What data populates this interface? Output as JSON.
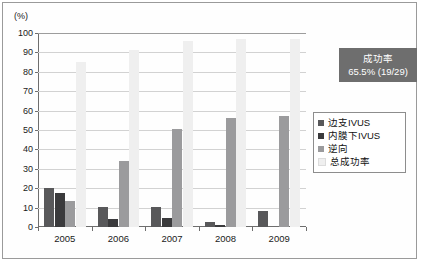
{
  "chart_data": {
    "type": "bar",
    "title": "",
    "subtitle": "",
    "xlabel": "",
    "ylabel": "(%)",
    "ylim": [
      0,
      100
    ],
    "ytick_step": 10,
    "yticks": [
      "100",
      "90",
      "80",
      "70",
      "60",
      "50",
      "40",
      "30",
      "20",
      "10",
      "0"
    ],
    "grid": true,
    "legend_position": "right",
    "categories": [
      "2005",
      "2006",
      "2007",
      "2008",
      "2009"
    ],
    "series": [
      {
        "name": "边支IVUS",
        "color": "#58585a",
        "values": [
          20.0,
          10.5,
          10.5,
          2.5,
          8.5
        ]
      },
      {
        "name": "内膜下IVUS",
        "color": "#3a3a3c",
        "values": [
          17.5,
          4.0,
          4.5,
          1.0,
          0.0
        ]
      },
      {
        "name": "逆向",
        "color": "#9b9b9d",
        "values": [
          13.5,
          34.0,
          50.5,
          56.0,
          57.0
        ]
      },
      {
        "name": "总成功率",
        "color": "#efefef",
        "values": [
          85.0,
          91.0,
          96.0,
          97.0,
          97.0
        ]
      }
    ]
  },
  "info_box": {
    "title": "成功率",
    "value": "65.5%  (19/29)",
    "background": "#6e6e6e",
    "text_color": "#ffffff"
  },
  "legend": {
    "items": [
      {
        "label": "边支IVUS",
        "color": "#58585a"
      },
      {
        "label": "内膜下IVUS",
        "color": "#3a3a3c"
      },
      {
        "label": "逆向",
        "color": "#9b9b9d"
      },
      {
        "label": "总成功率",
        "color": "#efefef"
      }
    ]
  }
}
